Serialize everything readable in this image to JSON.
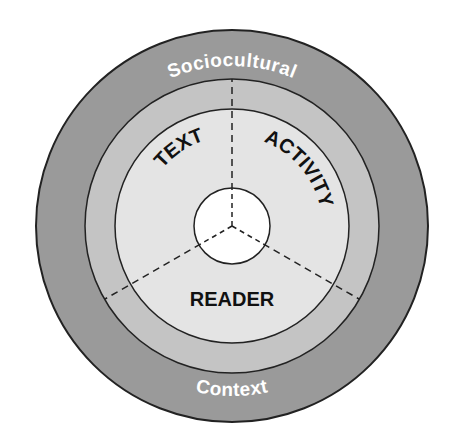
{
  "diagram": {
    "outer_ring": {
      "top_label": "Sociocultural",
      "bottom_label": "Context",
      "color": "#9a9a9a"
    },
    "middle_ring": {
      "color": "#c4c4c4"
    },
    "inner_disc": {
      "color": "#e4e4e4"
    },
    "core": {
      "color": "#ffffff"
    },
    "sectors": [
      {
        "label": "TEXT"
      },
      {
        "label": "ACTIVITY"
      },
      {
        "label": "READER"
      }
    ],
    "stroke_color": "#222222"
  }
}
